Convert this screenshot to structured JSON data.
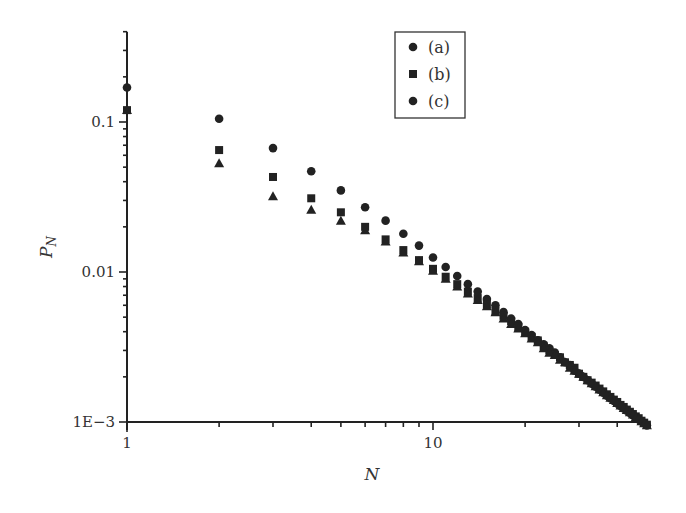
{
  "chart_data": {
    "type": "scatter",
    "title": "",
    "xlabel": "N",
    "ylabel": "P_N",
    "xscale": "log",
    "yscale": "log",
    "xlim": [
      1,
      50
    ],
    "ylim": [
      0.001,
      0.4
    ],
    "x_ticks": [
      {
        "value": 1,
        "label": "1"
      },
      {
        "value": 10,
        "label": "10"
      }
    ],
    "y_ticks": [
      {
        "value": 0.001,
        "label": "1E−3"
      },
      {
        "value": 0.01,
        "label": "0.01"
      },
      {
        "value": 0.1,
        "label": "0.1"
      }
    ],
    "grid": false,
    "legend_position": "upper center-right",
    "legend": [
      {
        "label": "(a)",
        "marker": "circle"
      },
      {
        "label": "(b)",
        "marker": "square"
      },
      {
        "label": "(c)",
        "marker": "circle"
      }
    ],
    "x": [
      1,
      2,
      3,
      4,
      5,
      6,
      7,
      8,
      9,
      10,
      11,
      12,
      13,
      14,
      15,
      16,
      17,
      18,
      19,
      20,
      21,
      22,
      23,
      24,
      25,
      26,
      27,
      28,
      29,
      30,
      31,
      32,
      33,
      34,
      35,
      36,
      37,
      38,
      39,
      40,
      41,
      42,
      43,
      44,
      45,
      46,
      47,
      48,
      49,
      50
    ],
    "series": [
      {
        "name": "(a)",
        "marker": "circle",
        "values": [
          0.17,
          0.105,
          0.067,
          0.047,
          0.035,
          0.027,
          0.022,
          0.018,
          0.015,
          0.0125,
          0.0108,
          0.0094,
          0.0083,
          0.0074,
          0.0066,
          0.006,
          0.0054,
          0.0049,
          0.0045,
          0.0041,
          0.0038,
          0.0035,
          0.0033,
          0.0031,
          0.0029,
          0.0027,
          0.0025,
          0.0024,
          0.0022,
          0.0021,
          0.002,
          0.0019,
          0.0018,
          0.00172,
          0.00164,
          0.00157,
          0.0015,
          0.00144,
          0.00138,
          0.00133,
          0.00128,
          0.00123,
          0.00119,
          0.00115,
          0.00111,
          0.00107,
          0.00104,
          0.00101,
          0.00098,
          0.00095
        ]
      },
      {
        "name": "(b)",
        "marker": "square",
        "values": [
          0.12,
          0.065,
          0.043,
          0.031,
          0.025,
          0.02,
          0.0165,
          0.014,
          0.012,
          0.0105,
          0.0093,
          0.0083,
          0.0074,
          0.0067,
          0.0061,
          0.0055,
          0.0051,
          0.0047,
          0.0043,
          0.004,
          0.0037,
          0.0035,
          0.0032,
          0.003,
          0.0028,
          0.0027,
          0.0025,
          0.0024,
          0.0023,
          0.0021,
          0.002,
          0.0019,
          0.00183,
          0.00175,
          0.00167,
          0.0016,
          0.00153,
          0.00147,
          0.00141,
          0.00136,
          0.0013,
          0.00126,
          0.00121,
          0.00117,
          0.00113,
          0.00109,
          0.00106,
          0.00102,
          0.00099,
          0.00096
        ]
      },
      {
        "name": "(c)",
        "marker": "triangle",
        "values": [
          0.12,
          0.053,
          0.032,
          0.026,
          0.022,
          0.019,
          0.016,
          0.0135,
          0.0118,
          0.0102,
          0.009,
          0.008,
          0.0072,
          0.0065,
          0.0059,
          0.0054,
          0.0049,
          0.0045,
          0.0042,
          0.0039,
          0.0036,
          0.0034,
          0.0031,
          0.0029,
          0.0028,
          0.0026,
          0.0025,
          0.0023,
          0.0022,
          0.0021,
          0.002,
          0.0019,
          0.00181,
          0.00173,
          0.00165,
          0.00158,
          0.00151,
          0.00145,
          0.0014,
          0.00134,
          0.00129,
          0.00124,
          0.0012,
          0.00116,
          0.00112,
          0.00108,
          0.00105,
          0.00101,
          0.00098,
          0.00095
        ]
      }
    ]
  }
}
